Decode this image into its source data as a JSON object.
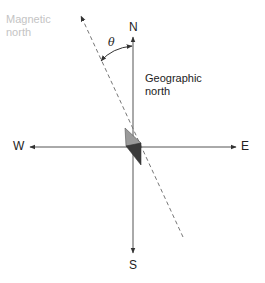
{
  "diagram": {
    "labels": {
      "north": "N",
      "south": "S",
      "west": "W",
      "east": "E",
      "magnetic_north_line1": "Magnetic",
      "magnetic_north_line2": "north",
      "geographic_north_line1": "Geographic",
      "geographic_north_line2": "north",
      "angle": "θ"
    },
    "colors": {
      "axis": "#555555",
      "dashed_line": "#777777",
      "magnetic_label": "#c4c4c4",
      "needle_light": "#9a9a9a",
      "needle_dark": "#3a3a3a"
    }
  }
}
